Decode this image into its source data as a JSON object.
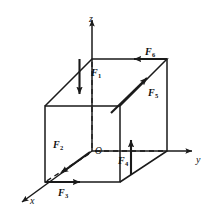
{
  "figure": {
    "kind": "3d-force-cube-diagram",
    "width": 214,
    "height": 215,
    "background_color": "#ffffff",
    "stroke_color": "#1a1a1a",
    "hidden_edge_style": "dashed"
  },
  "axes": {
    "x": {
      "label": "x",
      "direction": "down-left",
      "label_x": 30,
      "label_y": 196
    },
    "y": {
      "label": "y",
      "direction": "right",
      "label_x": 196,
      "label_y": 155
    },
    "z": {
      "label": "z",
      "direction": "up",
      "label_x": 89,
      "label_y": 14
    }
  },
  "origin": {
    "label": "O",
    "label_x": 95,
    "label_y": 147
  },
  "forces": [
    {
      "id": "F1",
      "base": "F",
      "sub": "1",
      "label_x": 91,
      "label_y": 68,
      "direction": "down",
      "description": "downward arrow on top face at front-top vertex"
    },
    {
      "id": "F2",
      "base": "F",
      "sub": "2",
      "label_x": 53,
      "label_y": 140,
      "direction": "down-left",
      "description": "arrow from origin along negative x toward viewer"
    },
    {
      "id": "F3",
      "base": "F",
      "sub": "3",
      "label_x": 58,
      "label_y": 188,
      "direction": "right",
      "description": "arrow along bottom front edge toward +y"
    },
    {
      "id": "F4",
      "base": "F",
      "sub": "4",
      "label_x": 118,
      "label_y": 156,
      "direction": "up",
      "description": "upward arrow on front right vertical edge"
    },
    {
      "id": "F5",
      "base": "F",
      "sub": "5",
      "label_x": 148,
      "label_y": 88,
      "direction": "up-right",
      "description": "arrow along receding top edge toward back"
    },
    {
      "id": "F6",
      "base": "F",
      "sub": "6",
      "label_x": 145,
      "label_y": 47,
      "direction": "left",
      "description": "leftward arrow along top back edge"
    }
  ]
}
